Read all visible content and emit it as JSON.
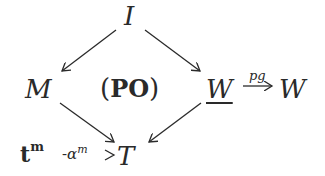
{
  "diagram": {
    "nodes": {
      "I": "I",
      "M": "M",
      "PO": "PO",
      "W_under": "W",
      "W": "W",
      "T": "T",
      "t": "t",
      "t_sup": "m"
    },
    "labels": {
      "pg": "pg",
      "alpha": "α",
      "alpha_sup": "m",
      "alpha_prefix": "-"
    },
    "edges": [
      {
        "from": "I",
        "to": "M"
      },
      {
        "from": "I",
        "to": "W_under"
      },
      {
        "from": "M",
        "to": "T"
      },
      {
        "from": "W_under",
        "to": "T"
      },
      {
        "from": "W_under",
        "to": "W",
        "label": "pg"
      },
      {
        "from": "t^m",
        "to": "T",
        "label": "α^m",
        "style": "dashed"
      }
    ],
    "colors": {
      "ink": "#2a2a2a",
      "background": "#ffffff"
    }
  }
}
